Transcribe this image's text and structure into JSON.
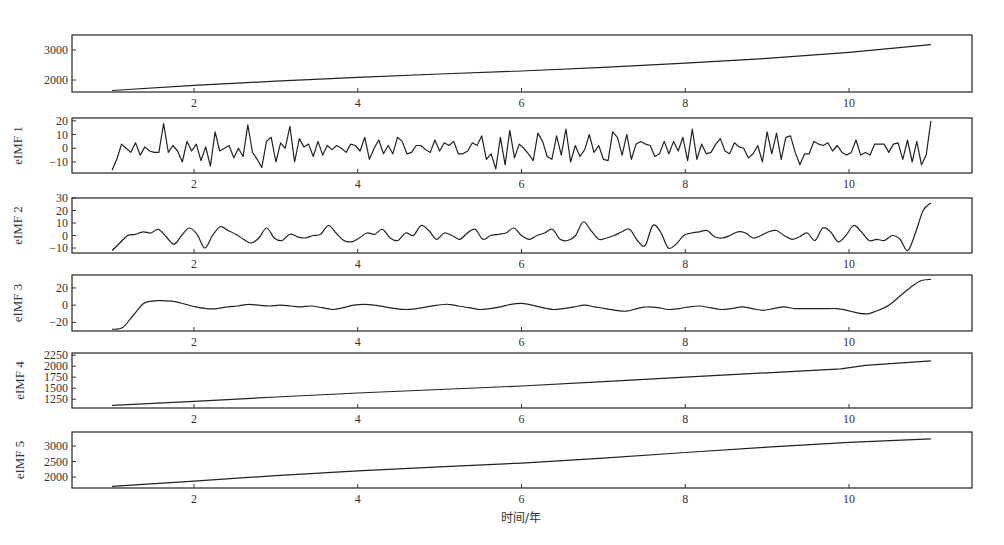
{
  "chart_data": {
    "type": "line",
    "title": "",
    "xlabel": "时间/年",
    "x_range": [
      0.0,
      12.0
    ],
    "x_ticks": [
      2,
      4,
      6,
      8,
      10
    ],
    "x_tick_labels": [
      "2",
      "4",
      "6",
      "8",
      "10"
    ],
    "grid": false,
    "legend": "none",
    "panels": [
      {
        "name": "original",
        "ylabel": "",
        "ylim": [
          1600,
          3500
        ],
        "y_ticks": [
          2000,
          3000
        ],
        "y_tick_labels": [
          "2000",
          "3000"
        ],
        "kind": "trend",
        "x": [
          1.0,
          2.0,
          3.0,
          4.0,
          5.0,
          6.0,
          7.0,
          8.0,
          9.0,
          10.0,
          11.0
        ],
        "values": [
          1650,
          1820,
          1960,
          2090,
          2200,
          2300,
          2420,
          2560,
          2720,
          2920,
          3180
        ]
      },
      {
        "name": "eIMF 1",
        "ylabel": "eIMF 1",
        "ylim": [
          -18,
          22
        ],
        "y_ticks": [
          -10,
          0,
          10,
          20
        ],
        "y_tick_labels": [
          "-10",
          "0",
          "10",
          "20"
        ],
        "kind": "noise",
        "x_start": 1.0,
        "x_end": 11.0,
        "values": [
          -16,
          -8,
          3,
          0,
          -3,
          4,
          -5,
          1,
          -2,
          -3,
          -3,
          18,
          -3,
          2,
          -2,
          -10,
          5,
          -2,
          3,
          -9,
          1,
          -13,
          12,
          -2,
          0,
          2,
          -7,
          0,
          -6,
          17,
          -3,
          -8,
          -14,
          5,
          8,
          -10,
          4,
          0,
          16,
          -10,
          7,
          1,
          3,
          -6,
          5,
          -5,
          2,
          -1,
          2,
          0,
          -3,
          3,
          2,
          -2,
          8,
          -8,
          0,
          6,
          -4,
          2,
          -4,
          8,
          5,
          -4,
          -3,
          2,
          2,
          -1,
          -3,
          6,
          -2,
          4,
          2,
          5,
          -4,
          -4,
          -2,
          4,
          2,
          9,
          -8,
          -4,
          -15,
          8,
          -12,
          13,
          -7,
          3,
          0,
          -4,
          -9,
          11,
          5,
          -6,
          -8,
          9,
          -5,
          14,
          -10,
          2,
          -6,
          -1,
          10,
          -3,
          2,
          -8,
          -9,
          12,
          8,
          -5,
          10,
          -8,
          3,
          5,
          3,
          2,
          -6,
          -4,
          5,
          -4,
          5,
          -2,
          8,
          -9,
          14,
          -8,
          3,
          -4,
          -3,
          3,
          7,
          -2,
          -4,
          4,
          1,
          0,
          -7,
          -4,
          2,
          -10,
          12,
          -4,
          11,
          -8,
          8,
          9,
          -3,
          -12,
          -4,
          -4,
          5,
          3,
          2,
          4,
          -2,
          2,
          -3,
          -5,
          -3,
          6,
          -5,
          -3,
          -5,
          3,
          3,
          3,
          -3,
          3,
          4,
          -8,
          6,
          -10,
          5,
          -12,
          -5,
          20
        ]
      },
      {
        "name": "eIMF 2",
        "ylabel": "eIMF 2",
        "ylim": [
          -14,
          30
        ],
        "y_ticks": [
          -10,
          0,
          10,
          20,
          30
        ],
        "y_tick_labels": [
          "-10",
          "0",
          "10",
          "20",
          "30"
        ],
        "kind": "smooth",
        "x_start": 1.0,
        "x_end": 11.0,
        "values": [
          -12,
          -6,
          0,
          1,
          3,
          2,
          5,
          -1,
          -7,
          0,
          6,
          1,
          -10,
          0,
          7,
          4,
          1,
          -3,
          -6,
          -2,
          6,
          -2,
          -4,
          1,
          -1,
          -2,
          0,
          1,
          8,
          2,
          -4,
          -5,
          -2,
          2,
          1,
          5,
          -2,
          -4,
          2,
          0,
          8,
          4,
          -3,
          2,
          0,
          -3,
          2,
          5,
          -3,
          0,
          1,
          2,
          6,
          0,
          -3,
          0,
          2,
          5,
          -3,
          -4,
          0,
          11,
          4,
          -3,
          -2,
          0,
          3,
          5,
          -4,
          -8,
          8,
          3,
          -10,
          -7,
          0,
          2,
          3,
          4,
          -1,
          -2,
          0,
          3,
          2,
          -2,
          0,
          3,
          4,
          0,
          -3,
          -1,
          2,
          -4,
          6,
          3,
          -5,
          0,
          8,
          3,
          -4,
          -3,
          -4,
          0,
          -3,
          -12,
          2,
          20,
          26
        ]
      },
      {
        "name": "eIMF 3",
        "ylabel": "eIMF 3",
        "ylim": [
          -30,
          35
        ],
        "y_ticks": [
          -20,
          0,
          20
        ],
        "y_tick_labels": [
          "-20",
          "0",
          "20"
        ],
        "kind": "smooth",
        "x_start": 1.0,
        "x_end": 11.0,
        "values": [
          -28,
          -26,
          -12,
          2,
          5,
          5,
          4,
          1,
          -2,
          -4,
          -4,
          -2,
          -1,
          1,
          0,
          -1,
          0,
          -1,
          -2,
          -1,
          -3,
          -5,
          -3,
          0,
          1,
          0,
          -2,
          -4,
          -5,
          -4,
          -2,
          0,
          1,
          -1,
          -3,
          -5,
          -4,
          -2,
          1,
          2,
          0,
          -3,
          -5,
          -4,
          -2,
          0,
          -2,
          -4,
          -6,
          -7,
          -4,
          -2,
          -3,
          -5,
          -4,
          -2,
          -1,
          -3,
          -5,
          -4,
          -2,
          -4,
          -6,
          -4,
          -2,
          -4,
          -4,
          -4,
          -4,
          -4,
          -6,
          -9,
          -10,
          -6,
          0,
          10,
          20,
          28,
          30
        ]
      },
      {
        "name": "eIMF 4",
        "ylabel": "eIMF 4",
        "ylim": [
          1050,
          2300
        ],
        "y_ticks": [
          1250,
          1500,
          1750,
          2000,
          2250
        ],
        "y_tick_labels": [
          "1250",
          "1500",
          "1750",
          "2000",
          "2250"
        ],
        "kind": "trend",
        "x": [
          1.0,
          2.0,
          3.0,
          4.0,
          5.0,
          6.0,
          7.0,
          8.0,
          9.0,
          9.9,
          10.2,
          11.0
        ],
        "values": [
          1110,
          1200,
          1300,
          1390,
          1470,
          1550,
          1650,
          1750,
          1850,
          1940,
          2020,
          2120
        ]
      },
      {
        "name": "eIMF 5",
        "ylabel": "eIMF 5",
        "ylim": [
          1650,
          3450
        ],
        "y_ticks": [
          2000,
          2500,
          3000
        ],
        "y_tick_labels": [
          "2000",
          "2500",
          "3000"
        ],
        "kind": "trend",
        "x": [
          1.0,
          2.0,
          3.0,
          4.0,
          5.0,
          6.0,
          7.0,
          8.0,
          9.0,
          10.0,
          11.0
        ],
        "values": [
          1700,
          1870,
          2050,
          2200,
          2330,
          2450,
          2610,
          2790,
          2960,
          3120,
          3230
        ]
      }
    ]
  }
}
